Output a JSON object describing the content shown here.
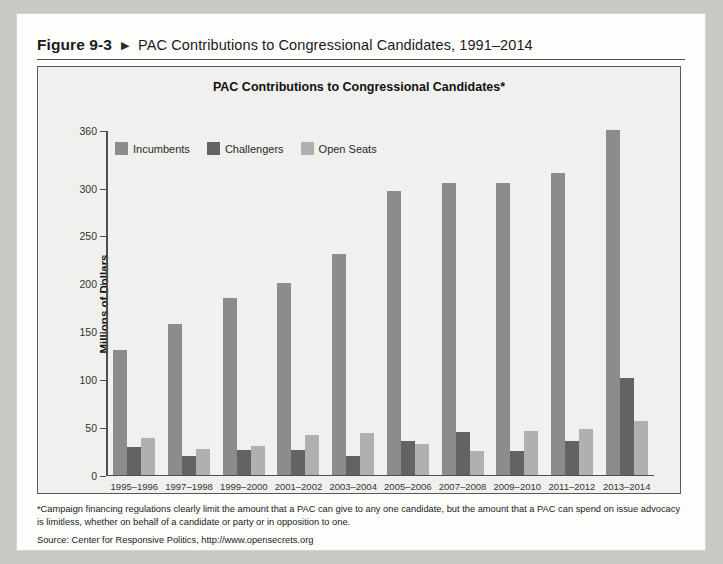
{
  "figure": {
    "number": "Figure 9-3",
    "arrow_icon": "triangle-right-icon",
    "title": "PAC Contributions to Congressional Candidates, 1991–2014"
  },
  "notes": {
    "footnote": "*Campaign financing regulations clearly limit the amount that a PAC can give to any one candidate, but the amount that a PAC can spend on issue advocacy is limitless, whether on behalf of a candidate or party or in opposition to one.",
    "source": "Source: Center for Responsive Politics, http://www.opensecrets.org"
  },
  "colors": {
    "incumbents": "#8c8c8c",
    "challengers": "#636363",
    "open_seats": "#b0b0b0",
    "axis": "#4f4f4f",
    "plot_background": "#f0f0ee",
    "page_background": "#fdfdfb"
  },
  "chart_data": {
    "type": "bar",
    "title": "PAC Contributions to Congressional Candidates*",
    "xlabel": "",
    "ylabel": "Millions of Dollars",
    "ylim": [
      0,
      360
    ],
    "yticks": [
      0,
      50,
      100,
      150,
      200,
      250,
      300,
      360
    ],
    "grid": false,
    "legend_position": "top-left-inside",
    "categories": [
      "1995–1996",
      "1997–1998",
      "1999–2000",
      "2001–2002",
      "2003–2004",
      "2005–2006",
      "2007–2008",
      "2009–2010",
      "2011–2012",
      "2013–2014"
    ],
    "series": [
      {
        "name": "Incumbents",
        "color": "#8c8c8c",
        "values": [
          130,
          158,
          185,
          200,
          231,
          296,
          305,
          305,
          315,
          360
        ]
      },
      {
        "name": "Challengers",
        "color": "#636363",
        "values": [
          29,
          20,
          26,
          26,
          20,
          36,
          45,
          25,
          35,
          101
        ]
      },
      {
        "name": "Open Seats",
        "color": "#b0b0b0",
        "values": [
          39,
          27,
          30,
          42,
          44,
          32,
          25,
          46,
          48,
          56
        ]
      }
    ]
  }
}
